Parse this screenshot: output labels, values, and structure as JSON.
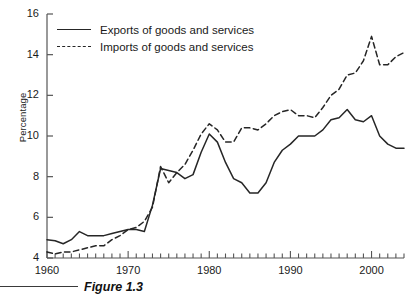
{
  "figure": {
    "caption": "Figure 1.3"
  },
  "legend": {
    "position": "top-left-inside",
    "entries": [
      {
        "label": "Exports of goods and services",
        "style": "solid"
      },
      {
        "label": "Imports of goods and services",
        "style": "dashed"
      }
    ]
  },
  "axes": {
    "ylabel": "Percentage",
    "xlabel": "",
    "ylim": [
      4,
      16
    ],
    "xlim": [
      1960,
      2004
    ],
    "ytick_labels": [
      "4",
      "6",
      "8",
      "10",
      "12",
      "14",
      "16"
    ],
    "yticks": [
      4,
      6,
      8,
      10,
      12,
      14,
      16
    ],
    "xtick_labels": [
      "1960",
      "1970",
      "1980",
      "1990",
      "2000"
    ],
    "xticks": [
      1960,
      1970,
      1980,
      1990,
      2000
    ],
    "minor_xtick_interval": 1,
    "grid": false
  },
  "colors": {
    "line": "#262626",
    "axis": "#555555",
    "text": "#1a1a1a",
    "background": "#ffffff"
  },
  "chart_data": {
    "type": "line",
    "title": "",
    "xlabel": "",
    "ylabel": "Percentage",
    "xlim": [
      1960,
      2004
    ],
    "ylim": [
      4,
      16
    ],
    "grid": false,
    "legend_position": "top-left-inside",
    "x": [
      1960,
      1961,
      1962,
      1963,
      1964,
      1965,
      1966,
      1967,
      1968,
      1969,
      1970,
      1971,
      1972,
      1973,
      1974,
      1975,
      1976,
      1977,
      1978,
      1979,
      1980,
      1981,
      1982,
      1983,
      1984,
      1985,
      1986,
      1987,
      1988,
      1989,
      1990,
      1991,
      1992,
      1993,
      1994,
      1995,
      1996,
      1997,
      1998,
      1999,
      2000,
      2001,
      2002,
      2003,
      2004
    ],
    "series": [
      {
        "name": "Exports of goods and services",
        "style": "solid",
        "values": [
          4.9,
          4.85,
          4.7,
          4.9,
          5.3,
          5.1,
          5.1,
          5.1,
          5.2,
          5.3,
          5.4,
          5.4,
          5.3,
          6.6,
          8.4,
          8.3,
          8.2,
          7.9,
          8.1,
          9.2,
          10.1,
          9.7,
          8.7,
          7.9,
          7.7,
          7.2,
          7.2,
          7.7,
          8.7,
          9.3,
          9.6,
          10.0,
          10.0,
          10.0,
          10.3,
          10.8,
          10.9,
          11.3,
          10.8,
          10.7,
          11.0,
          10.0,
          9.6,
          9.4,
          9.4
        ]
      },
      {
        "name": "Imports of goods and services",
        "style": "dashed",
        "values": [
          4.3,
          4.2,
          4.3,
          4.3,
          4.4,
          4.5,
          4.6,
          4.6,
          4.9,
          5.1,
          5.4,
          5.5,
          5.8,
          6.5,
          8.5,
          7.7,
          8.2,
          8.6,
          9.3,
          10.1,
          10.6,
          10.3,
          9.7,
          9.7,
          10.4,
          10.4,
          10.3,
          10.6,
          11.0,
          11.2,
          11.3,
          11.0,
          11.0,
          10.9,
          11.4,
          12.0,
          12.3,
          13.0,
          13.1,
          13.7,
          14.9,
          13.5,
          13.5,
          13.9,
          14.1
        ]
      }
    ]
  }
}
